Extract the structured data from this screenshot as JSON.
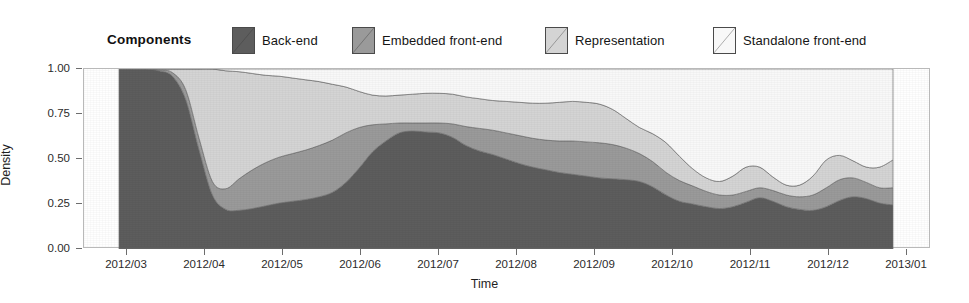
{
  "legend": {
    "title": "Components",
    "items": [
      {
        "label": "Back-end",
        "color": "#5d5d5d",
        "icon": "legend-swatch-icon"
      },
      {
        "label": "Embedded front-end",
        "color": "#9a9a9a",
        "icon": "legend-swatch-icon"
      },
      {
        "label": "Representation",
        "color": "#d4d4d4",
        "icon": "legend-swatch-icon"
      },
      {
        "label": "Standalone front-end",
        "color": "#f8f8f8",
        "icon": "legend-swatch-icon"
      }
    ]
  },
  "axes": {
    "y_title": "Density",
    "x_title": "Time",
    "y_ticks": [
      "0.00",
      "0.25",
      "0.50",
      "0.75",
      "1.00"
    ],
    "x_ticks": [
      "2012/03",
      "2012/04",
      "2012/05",
      "2012/06",
      "2012/07",
      "2012/08",
      "2012/09",
      "2012/10",
      "2012/11",
      "2012/12",
      "2013/01"
    ]
  },
  "chart_data": {
    "type": "area",
    "title": "",
    "subtitle": "",
    "xlabel": "Time",
    "ylabel": "Density",
    "ylim": [
      0,
      1
    ],
    "xlim": [
      "2012/03",
      "2013/01"
    ],
    "grid": false,
    "stacked": true,
    "normalized": true,
    "legend_position": "top",
    "legend_title": "Components",
    "annotations": [],
    "tick_labels": {
      "y": [
        "0.00",
        "0.25",
        "0.50",
        "0.75",
        "1.00"
      ],
      "x": [
        "2012/03",
        "2012/04",
        "2012/05",
        "2012/06",
        "2012/07",
        "2012/08",
        "2012/09",
        "2012/10",
        "2012/11",
        "2012/12",
        "2013/01"
      ]
    },
    "x": [
      "2012/03/01",
      "2012/03/10",
      "2012/03/18",
      "2012/03/24",
      "2012/03/28",
      "2012/04/01",
      "2012/04/05",
      "2012/04/10",
      "2012/04/16",
      "2012/04/22",
      "2012/04/28",
      "2012/05/04",
      "2012/05/10",
      "2012/05/16",
      "2012/05/22",
      "2012/05/28",
      "2012/06/03",
      "2012/06/09",
      "2012/06/15",
      "2012/06/21",
      "2012/06/27",
      "2012/07/03",
      "2012/07/09",
      "2012/07/15",
      "2012/07/21",
      "2012/07/27",
      "2012/08/02",
      "2012/08/08",
      "2012/08/14",
      "2012/08/20",
      "2012/08/26",
      "2012/09/01",
      "2012/09/07",
      "2012/09/13",
      "2012/09/19",
      "2012/09/25",
      "2012/10/01",
      "2012/10/05",
      "2012/10/09",
      "2012/10/13",
      "2012/10/17",
      "2012/10/21",
      "2012/10/25",
      "2012/10/29",
      "2012/11/02",
      "2012/11/06",
      "2012/11/10",
      "2012/11/14",
      "2012/11/18",
      "2012/11/22",
      "2012/11/26",
      "2012/11/30",
      "2012/12/04",
      "2012/12/08",
      "2012/12/12",
      "2012/12/16",
      "2012/12/20",
      "2012/12/24",
      "2012/12/28"
    ],
    "series": [
      {
        "name": "Back-end",
        "color": "#5d5d5d",
        "values": [
          1.0,
          1.0,
          1.0,
          0.99,
          0.96,
          0.83,
          0.55,
          0.3,
          0.22,
          0.215,
          0.225,
          0.24,
          0.255,
          0.265,
          0.275,
          0.29,
          0.315,
          0.37,
          0.45,
          0.54,
          0.6,
          0.645,
          0.655,
          0.65,
          0.645,
          0.62,
          0.575,
          0.545,
          0.525,
          0.5,
          0.475,
          0.455,
          0.44,
          0.425,
          0.415,
          0.405,
          0.395,
          0.39,
          0.385,
          0.375,
          0.345,
          0.3,
          0.265,
          0.25,
          0.235,
          0.225,
          0.235,
          0.26,
          0.285,
          0.265,
          0.235,
          0.22,
          0.215,
          0.235,
          0.27,
          0.29,
          0.28,
          0.255,
          0.245
        ]
      },
      {
        "name": "Embedded front-end",
        "color": "#9a9a9a",
        "values": [
          0.0,
          0.0,
          0.0,
          0.005,
          0.02,
          0.055,
          0.065,
          0.075,
          0.115,
          0.175,
          0.215,
          0.24,
          0.255,
          0.265,
          0.275,
          0.285,
          0.29,
          0.275,
          0.225,
          0.15,
          0.095,
          0.055,
          0.045,
          0.05,
          0.055,
          0.075,
          0.105,
          0.125,
          0.135,
          0.145,
          0.155,
          0.16,
          0.165,
          0.175,
          0.185,
          0.19,
          0.195,
          0.19,
          0.175,
          0.155,
          0.14,
          0.125,
          0.115,
          0.1,
          0.085,
          0.075,
          0.065,
          0.06,
          0.055,
          0.06,
          0.065,
          0.07,
          0.085,
          0.105,
          0.115,
          0.105,
          0.09,
          0.085,
          0.095
        ]
      },
      {
        "name": "Representation",
        "color": "#d4d4d4",
        "values": [
          0.0,
          0.0,
          0.0,
          0.005,
          0.02,
          0.115,
          0.385,
          0.625,
          0.655,
          0.595,
          0.535,
          0.485,
          0.45,
          0.42,
          0.39,
          0.355,
          0.31,
          0.255,
          0.2,
          0.165,
          0.155,
          0.155,
          0.16,
          0.165,
          0.165,
          0.165,
          0.165,
          0.165,
          0.165,
          0.175,
          0.185,
          0.195,
          0.205,
          0.215,
          0.22,
          0.22,
          0.215,
          0.195,
          0.165,
          0.145,
          0.155,
          0.165,
          0.135,
          0.095,
          0.075,
          0.075,
          0.105,
          0.135,
          0.115,
          0.075,
          0.055,
          0.065,
          0.105,
          0.155,
          0.135,
          0.095,
          0.085,
          0.115,
          0.155
        ]
      },
      {
        "name": "Standalone front-end",
        "color": "#f8f8f8",
        "values": [
          0.0,
          0.0,
          0.0,
          0.0,
          0.0,
          0.0,
          0.0,
          0.0,
          0.01,
          0.015,
          0.025,
          0.035,
          0.04,
          0.05,
          0.06,
          0.07,
          0.085,
          0.1,
          0.125,
          0.145,
          0.15,
          0.145,
          0.14,
          0.135,
          0.135,
          0.14,
          0.155,
          0.165,
          0.175,
          0.18,
          0.185,
          0.19,
          0.19,
          0.185,
          0.18,
          0.185,
          0.195,
          0.225,
          0.275,
          0.325,
          0.36,
          0.41,
          0.485,
          0.555,
          0.605,
          0.625,
          0.595,
          0.545,
          0.545,
          0.6,
          0.645,
          0.645,
          0.595,
          0.505,
          0.48,
          0.51,
          0.545,
          0.545,
          0.505
        ]
      }
    ]
  }
}
